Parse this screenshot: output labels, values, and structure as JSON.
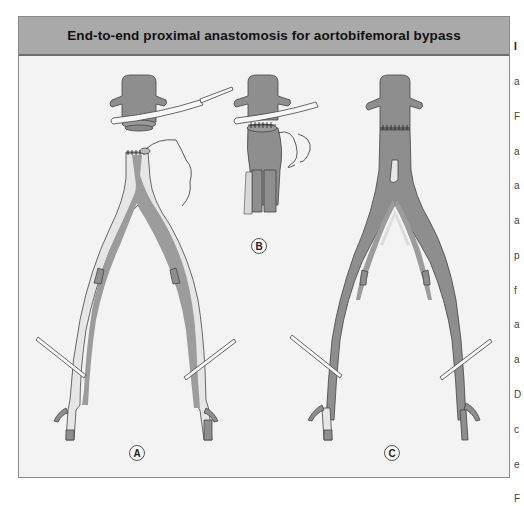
{
  "figure": {
    "title": "End-to-end proximal anastomosis for aortobifemoral bypass",
    "colors": {
      "header_bg": "#a9a9a9",
      "header_border": "#6e6e6e",
      "panel_bg": "#f3f3f3",
      "vessel": "#8e8e8e",
      "lumen_pale": "#e6e6e6",
      "outline": "#444444",
      "clamp": "#f7f7f7"
    },
    "panels": [
      {
        "id": "A",
        "label": "A",
        "description": "Transected aorta with proximal stump clamped and oversewn distal aortic stump with endarterectomized iliac arteries"
      },
      {
        "id": "B",
        "label": "B",
        "description": "Graft sewn end-to-end to proximal aortic stump under clamp, suture needle attached"
      },
      {
        "id": "C",
        "label": "C",
        "description": "Completed end-to-end aortobifemoral graft with limbs tunneled to femoral arteries"
      }
    ]
  },
  "caption_edge_letters": [
    "I",
    "a",
    "F",
    "a",
    "a",
    "a",
    "p",
    "f",
    "a",
    "a",
    "D",
    "c",
    "e",
    "F"
  ]
}
